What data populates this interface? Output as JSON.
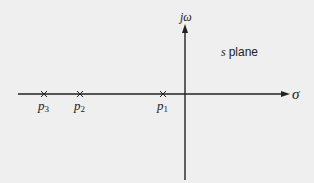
{
  "diagram": {
    "title": "s plane",
    "title_var": "s",
    "title_rest": "plane",
    "axes": {
      "horizontal_label": "σ",
      "vertical_label": "jω"
    },
    "poles": [
      {
        "name": "p",
        "sub": "3",
        "x": 44
      },
      {
        "name": "p",
        "sub": "2",
        "x": 80
      },
      {
        "name": "p",
        "sub": "1",
        "x": 163
      }
    ],
    "colors": {
      "background": "#efefef",
      "ink": "#222222"
    }
  }
}
